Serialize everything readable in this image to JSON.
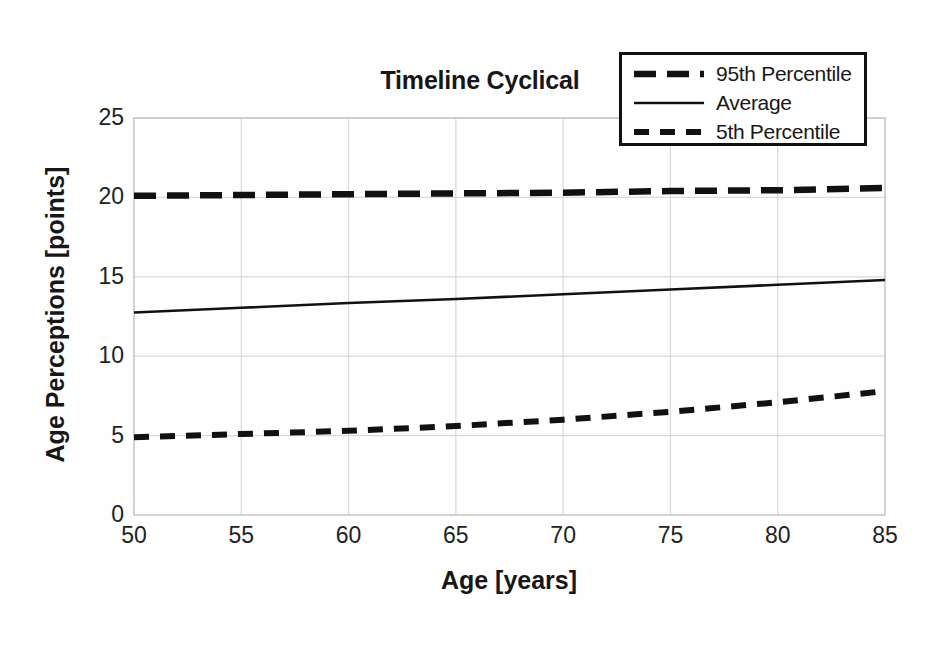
{
  "chart_data": {
    "type": "line",
    "title": "Timeline Cyclical",
    "xlabel": "Age [years]",
    "ylabel": "Age Perceptions [points]",
    "xlim": [
      50,
      85
    ],
    "ylim": [
      0,
      25
    ],
    "xticks": [
      50,
      55,
      60,
      65,
      70,
      75,
      80,
      85
    ],
    "yticks": [
      0,
      5,
      10,
      15,
      20,
      25
    ],
    "grid": true,
    "legend_position": "top-right",
    "x": [
      50,
      55,
      60,
      65,
      70,
      75,
      80,
      85
    ],
    "series": [
      {
        "name": "95th Percentile",
        "style": "long-dashed",
        "color": "#111111",
        "values": [
          20.1,
          20.15,
          20.2,
          20.25,
          20.3,
          20.4,
          20.45,
          20.6
        ]
      },
      {
        "name": "Average",
        "style": "solid",
        "color": "#111111",
        "values": [
          12.75,
          13.05,
          13.35,
          13.6,
          13.9,
          14.2,
          14.5,
          14.8
        ]
      },
      {
        "name": "5th Percentile",
        "style": "short-dashed",
        "color": "#111111",
        "values": [
          4.9,
          5.1,
          5.3,
          5.6,
          6.0,
          6.5,
          7.1,
          7.8
        ]
      }
    ]
  },
  "legend": {
    "items": [
      {
        "label": "95th Percentile",
        "style": "long-dashed"
      },
      {
        "label": "Average",
        "style": "solid"
      },
      {
        "label": "5th Percentile",
        "style": "short-dashed"
      }
    ]
  },
  "axes": {
    "x_tick_labels": [
      "50",
      "55",
      "60",
      "65",
      "70",
      "75",
      "80",
      "85"
    ],
    "y_tick_labels": [
      "0",
      "5",
      "10",
      "15",
      "20",
      "25"
    ]
  },
  "colors": {
    "line": "#111111",
    "grid": "#d9d9d9",
    "frame": "#c8c8c8",
    "background": "#fefefe",
    "text": "#171717"
  }
}
